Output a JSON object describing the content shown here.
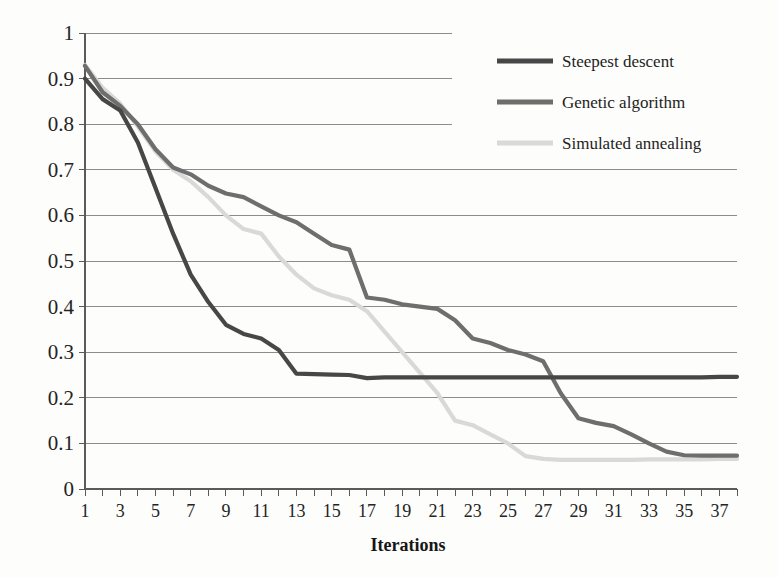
{
  "chart_data": {
    "type": "line",
    "title": "",
    "xlabel": "Iterations",
    "ylabel": "",
    "xlim": [
      1,
      38
    ],
    "ylim": [
      0,
      1
    ],
    "grid": true,
    "legend_position": "top-right",
    "y_ticks": [
      "0",
      "0.1",
      "0.2",
      "0.3",
      "0.4",
      "0.5",
      "0.6",
      "0.7",
      "0.8",
      "0.9",
      "1"
    ],
    "y_tick_values": [
      0,
      0.1,
      0.2,
      0.3,
      0.4,
      0.5,
      0.6,
      0.7,
      0.8,
      0.9,
      1
    ],
    "x_ticks": [
      "1",
      "3",
      "5",
      "7",
      "9",
      "11",
      "13",
      "15",
      "17",
      "19",
      "21",
      "23",
      "25",
      "27",
      "29",
      "31",
      "33",
      "35",
      "37"
    ],
    "x_tick_values": [
      1,
      3,
      5,
      7,
      9,
      11,
      13,
      15,
      17,
      19,
      21,
      23,
      25,
      27,
      29,
      31,
      33,
      35,
      37
    ],
    "x": [
      1,
      2,
      3,
      4,
      5,
      6,
      7,
      8,
      9,
      10,
      11,
      12,
      13,
      14,
      15,
      16,
      17,
      18,
      19,
      20,
      21,
      22,
      23,
      24,
      25,
      26,
      27,
      28,
      29,
      30,
      31,
      32,
      33,
      34,
      35,
      36,
      37,
      38
    ],
    "series": [
      {
        "name": "Steepest descent",
        "color": "#474747",
        "values": [
          0.9,
          0.855,
          0.83,
          0.76,
          0.66,
          0.56,
          0.47,
          0.41,
          0.36,
          0.34,
          0.33,
          0.305,
          0.253,
          0.252,
          0.251,
          0.25,
          0.243,
          0.245,
          0.245,
          0.245,
          0.245,
          0.245,
          0.245,
          0.245,
          0.245,
          0.245,
          0.245,
          0.245,
          0.245,
          0.245,
          0.245,
          0.245,
          0.245,
          0.245,
          0.245,
          0.245,
          0.246,
          0.246
        ]
      },
      {
        "name": "Genetic algorithm",
        "color": "#6e6e6e",
        "values": [
          0.928,
          0.87,
          0.84,
          0.8,
          0.745,
          0.705,
          0.69,
          0.665,
          0.648,
          0.64,
          0.62,
          0.6,
          0.585,
          0.56,
          0.535,
          0.525,
          0.42,
          0.415,
          0.405,
          0.4,
          0.395,
          0.37,
          0.33,
          0.32,
          0.305,
          0.295,
          0.28,
          0.21,
          0.155,
          0.145,
          0.138,
          0.12,
          0.1,
          0.082,
          0.074,
          0.073,
          0.073,
          0.073
        ]
      },
      {
        "name": "Simulated annealing",
        "color": "#d9d9d9",
        "values": [
          0.93,
          0.88,
          0.845,
          0.795,
          0.74,
          0.7,
          0.675,
          0.64,
          0.6,
          0.57,
          0.56,
          0.51,
          0.47,
          0.44,
          0.425,
          0.415,
          0.39,
          0.345,
          0.3,
          0.255,
          0.21,
          0.15,
          0.14,
          0.12,
          0.1,
          0.072,
          0.066,
          0.064,
          0.064,
          0.064,
          0.064,
          0.064,
          0.065,
          0.065,
          0.065,
          0.065,
          0.066,
          0.066
        ]
      }
    ]
  },
  "legend": {
    "entries": [
      {
        "label": "Steepest descent",
        "color": "#474747"
      },
      {
        "label": "Genetic algorithm",
        "color": "#6e6e6e"
      },
      {
        "label": "Simulated annealing",
        "color": "#d9d9d9"
      }
    ]
  },
  "axis": {
    "x_title": "Iterations"
  }
}
